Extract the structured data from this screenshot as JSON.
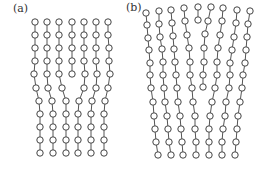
{
  "figure": {
    "panels": [
      {
        "label": "(a)",
        "columns": [
          [
            [
              35,
              22
            ],
            [
              35,
              35
            ],
            [
              35,
              48
            ],
            [
              35,
              61
            ],
            [
              34,
              74
            ],
            [
              36,
              88
            ],
            [
              39,
              101
            ],
            [
              40,
              114
            ],
            [
              40,
              127
            ],
            [
              40,
              140
            ],
            [
              40,
              153
            ]
          ],
          [
            [
              47,
              22
            ],
            [
              47,
              35
            ],
            [
              47,
              48
            ],
            [
              47,
              61
            ],
            [
              47,
              74
            ],
            [
              48,
              88
            ],
            [
              52,
              101
            ],
            [
              53,
              114
            ],
            [
              53,
              127
            ],
            [
              53,
              140
            ],
            [
              53,
              153
            ]
          ],
          [
            [
              59,
              22
            ],
            [
              59,
              35
            ],
            [
              59,
              48
            ],
            [
              59,
              61
            ],
            [
              59,
              74
            ],
            [
              62,
              88
            ],
            [
              66,
              101
            ],
            [
              66,
              114
            ],
            [
              66,
              127
            ],
            [
              66,
              140
            ],
            [
              66,
              153
            ]
          ],
          [
            [
              72,
              22
            ],
            [
              72,
              35
            ],
            [
              72,
              48
            ],
            [
              72,
              61
            ],
            [
              72,
              74
            ]
          ],
          [
            [
              84,
              22
            ],
            [
              84,
              35
            ],
            [
              84,
              48
            ],
            [
              84,
              61
            ],
            [
              85,
              74
            ],
            [
              84,
              88
            ],
            [
              79,
              101
            ],
            [
              78,
              114
            ],
            [
              78,
              127
            ],
            [
              78,
              140
            ],
            [
              78,
              153
            ]
          ],
          [
            [
              96,
              22
            ],
            [
              96,
              35
            ],
            [
              96,
              48
            ],
            [
              96,
              61
            ],
            [
              97,
              74
            ],
            [
              96,
              88
            ],
            [
              92,
              101
            ],
            [
              91,
              114
            ],
            [
              91,
              127
            ],
            [
              91,
              140
            ],
            [
              91,
              153
            ]
          ],
          [
            [
              108,
              22
            ],
            [
              108,
              35
            ],
            [
              109,
              48
            ],
            [
              109,
              61
            ],
            [
              110,
              74
            ],
            [
              108,
              88
            ],
            [
              105,
              101
            ],
            [
              104,
              114
            ],
            [
              104,
              127
            ],
            [
              104,
              140
            ],
            [
              104,
              153
            ]
          ]
        ]
      },
      {
        "label": "(b)",
        "columns": [
          [
            [
              146,
              13
            ],
            [
              147,
              25
            ],
            [
              148,
              38
            ],
            [
              149,
              50
            ],
            [
              150,
              63
            ],
            [
              150,
              75
            ],
            [
              151,
              88
            ],
            [
              153,
              102
            ],
            [
              154,
              116
            ],
            [
              155,
              129
            ],
            [
              156,
              142
            ],
            [
              158,
              155
            ]
          ],
          [
            [
              159,
              11
            ],
            [
              159,
              24
            ],
            [
              160,
              37
            ],
            [
              162,
              49
            ],
            [
              163,
              62
            ],
            [
              163,
              75
            ],
            [
              164,
              88
            ],
            [
              165,
              102
            ],
            [
              167,
              116
            ],
            [
              168,
              129
            ],
            [
              169,
              142
            ],
            [
              171,
              155
            ]
          ],
          [
            [
              171,
              10
            ],
            [
              172,
              23
            ],
            [
              173,
              36
            ],
            [
              174,
              49
            ],
            [
              175,
              62
            ],
            [
              176,
              75
            ],
            [
              177,
              88
            ],
            [
              178,
              102
            ],
            [
              180,
              116
            ],
            [
              181,
              129
            ],
            [
              182,
              142
            ],
            [
              183,
              155
            ]
          ],
          [
            [
              184,
              8
            ],
            [
              185,
              21
            ],
            [
              187,
              35
            ],
            [
              189,
              48
            ],
            [
              190,
              62
            ],
            [
              190,
              75
            ],
            [
              192,
              88
            ],
            [
              193,
              102
            ],
            [
              195,
              116
            ],
            [
              195,
              129
            ],
            [
              196,
              142
            ],
            [
              196,
              155
            ]
          ],
          [
            [
              198,
              7
            ],
            [
              198,
              20
            ]
          ],
          [
            [
              211,
              7
            ],
            [
              208,
              21
            ],
            [
              205,
              34
            ],
            [
              204,
              48
            ],
            [
              204,
              62
            ],
            [
              203,
              75
            ],
            [
              203,
              87
            ]
          ],
          [
            [
              223,
              8
            ],
            [
              222,
              21
            ],
            [
              220,
              35
            ],
            [
              218,
              48
            ],
            [
              217,
              62
            ],
            [
              217,
              75
            ],
            [
              215,
              88
            ],
            [
              212,
              102
            ],
            [
              210,
              116
            ],
            [
              209,
              129
            ],
            [
              209,
              142
            ],
            [
              209,
              155
            ]
          ],
          [
            [
              237,
              10
            ],
            [
              236,
              23
            ],
            [
              234,
              37
            ],
            [
              232,
              50
            ],
            [
              230,
              63
            ],
            [
              230,
              75
            ],
            [
              229,
              88
            ],
            [
              226,
              102
            ],
            [
              225,
              116
            ],
            [
              223,
              129
            ],
            [
              222,
              142
            ],
            [
              222,
              155
            ]
          ],
          [
            [
              250,
              11
            ],
            [
              248,
              24
            ],
            [
              247,
              37
            ],
            [
              246,
              50
            ],
            [
              245,
              63
            ],
            [
              243,
              75
            ],
            [
              242,
              88
            ],
            [
              240,
              102
            ],
            [
              238,
              116
            ],
            [
              237,
              129
            ],
            [
              236,
              142
            ],
            [
              235,
              155
            ]
          ]
        ]
      }
    ],
    "style": {
      "node_radius": 3.2,
      "node_stroke": "#444444",
      "node_fill": "#ffffff",
      "line_color": "#555555"
    }
  }
}
